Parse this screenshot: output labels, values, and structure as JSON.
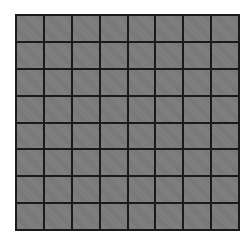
{
  "grid": {
    "rows": 8,
    "cols": 8,
    "cell_color": "#7b7b7b",
    "line_color": "#1a1a1a",
    "background": "#ffffff"
  }
}
